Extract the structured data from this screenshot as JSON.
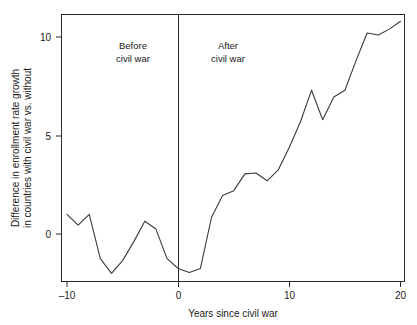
{
  "chart_data": {
    "type": "line",
    "title": "",
    "xlabel": "Years since civil war",
    "ylabel": "Difference in enrollment rate growth in countries with civil war vs. without",
    "ylabel_line1": "Difference in enrollment rate growth",
    "ylabel_line2": "in countries with civil war vs. without",
    "xlim": [
      -10.5,
      20.4
    ],
    "ylim": [
      -2.6,
      11.4
    ],
    "xticks": [
      -10,
      0,
      10,
      20
    ],
    "xticklabels": [
      "–10",
      "0",
      "10",
      "20"
    ],
    "yticks": [
      0,
      5,
      10
    ],
    "yticklabels": [
      "0",
      "5",
      "10"
    ],
    "grid": false,
    "legend": "none",
    "line_color": "#3a3a3a",
    "frame_color": "#2b2b2b",
    "annotations": [
      {
        "text_line1": "Before",
        "text_line2": "civil war",
        "x": -5,
        "y": 9.6
      },
      {
        "text_line1": "After",
        "text_line2": "civil war",
        "x": 5.2,
        "y": 9.6
      }
    ],
    "reference_line": {
      "x": 0,
      "label": "civil war onset"
    },
    "x": [
      -10,
      -9,
      -8,
      -7,
      -6,
      -5,
      -4,
      -3,
      -2,
      -1,
      0,
      1,
      2,
      3,
      4,
      5,
      6,
      7,
      8,
      9,
      10,
      11,
      12,
      13,
      14,
      15,
      16,
      17,
      18,
      19,
      20
    ],
    "values": [
      1.0,
      0.45,
      1.0,
      -1.25,
      -2.0,
      -1.35,
      -0.4,
      0.65,
      0.25,
      -1.25,
      -1.75,
      -1.95,
      -1.75,
      0.85,
      1.95,
      2.2,
      3.05,
      3.1,
      2.7,
      3.25,
      4.4,
      5.7,
      7.3,
      5.8,
      6.95,
      7.3,
      8.8,
      10.2,
      10.1,
      10.4,
      10.8
    ]
  },
  "xlabel_text": "Years since civil war"
}
